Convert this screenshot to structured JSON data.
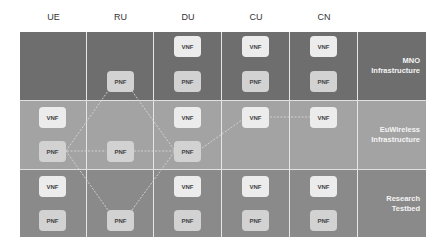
{
  "diagram": {
    "columns": [
      {
        "id": "ue",
        "label": "UE",
        "x": 20,
        "w": 67
      },
      {
        "id": "ru",
        "label": "RU",
        "x": 87,
        "w": 67
      },
      {
        "id": "du",
        "label": "DU",
        "x": 154,
        "w": 68
      },
      {
        "id": "cu",
        "label": "CU",
        "x": 222,
        "w": 68
      },
      {
        "id": "cn",
        "label": "CN",
        "x": 290,
        "w": 68
      }
    ],
    "rows": [
      {
        "id": "mno",
        "label_line1": "MNO",
        "label_line2": "Infrastructure",
        "color": "#6e6e6e",
        "top": 0,
        "h": 68
      },
      {
        "id": "euwireless",
        "label_line1": "EuWireless",
        "label_line2": "Infrastructure",
        "color": "#a3a3a3",
        "top": 68,
        "h": 69
      },
      {
        "id": "research",
        "label_line1": "Research",
        "label_line2": "Testbed",
        "color": "#8a8a8a",
        "top": 137,
        "h": 68
      }
    ],
    "nodes": {
      "mno": [
        {
          "col": "ru",
          "type": "pnf",
          "label": "PNF",
          "cx": 120,
          "cy": 81
        },
        {
          "col": "du",
          "type": "vnf",
          "label": "VNF",
          "cx": 188,
          "cy": 46
        },
        {
          "col": "du",
          "type": "pnf",
          "label": "PNF",
          "cx": 188,
          "cy": 81
        },
        {
          "col": "cu",
          "type": "vnf",
          "label": "VNF",
          "cx": 256,
          "cy": 46
        },
        {
          "col": "cu",
          "type": "pnf",
          "label": "PNF",
          "cx": 256,
          "cy": 81
        },
        {
          "col": "cn",
          "type": "vnf",
          "label": "VNF",
          "cx": 324,
          "cy": 46
        },
        {
          "col": "cn",
          "type": "pnf",
          "label": "PNF",
          "cx": 324,
          "cy": 81
        }
      ],
      "euwireless": [
        {
          "col": "ue",
          "type": "vnf",
          "label": "VNF",
          "cx": 53,
          "cy": 117
        },
        {
          "col": "ue",
          "type": "pnf",
          "label": "PNF",
          "cx": 53,
          "cy": 151
        },
        {
          "col": "ru",
          "type": "pnf",
          "label": "PNF",
          "cx": 120,
          "cy": 151
        },
        {
          "col": "du",
          "type": "vnf",
          "label": "VNF",
          "cx": 188,
          "cy": 117
        },
        {
          "col": "du",
          "type": "pnf",
          "label": "PNF",
          "cx": 188,
          "cy": 151
        },
        {
          "col": "cu",
          "type": "vnf",
          "label": "VNF",
          "cx": 256,
          "cy": 117
        },
        {
          "col": "cn",
          "type": "vnf",
          "label": "VNF",
          "cx": 324,
          "cy": 117
        }
      ],
      "research": [
        {
          "col": "ue",
          "type": "vnf",
          "label": "VNF",
          "cx": 53,
          "cy": 186
        },
        {
          "col": "ue",
          "type": "pnf",
          "label": "PNF",
          "cx": 53,
          "cy": 220
        },
        {
          "col": "ru",
          "type": "pnf",
          "label": "PNF",
          "cx": 120,
          "cy": 220
        },
        {
          "col": "du",
          "type": "vnf",
          "label": "VNF",
          "cx": 188,
          "cy": 186
        },
        {
          "col": "du",
          "type": "pnf",
          "label": "PNF",
          "cx": 188,
          "cy": 220
        },
        {
          "col": "cu",
          "type": "vnf",
          "label": "VNF",
          "cx": 256,
          "cy": 186
        },
        {
          "col": "cu",
          "type": "pnf",
          "label": "PNF",
          "cx": 256,
          "cy": 220
        },
        {
          "col": "cn",
          "type": "vnf",
          "label": "VNF",
          "cx": 324,
          "cy": 186
        },
        {
          "col": "cn",
          "type": "pnf",
          "label": "PNF",
          "cx": 324,
          "cy": 220
        }
      ]
    },
    "links": [
      {
        "from": "UE PNF (EuWireless)",
        "to": "RU PNF (MNO)",
        "x1": 66,
        "y1": 151,
        "x2": 108,
        "y2": 91
      },
      {
        "from": "RU PNF (MNO)",
        "to": "DU PNF (EuWireless)",
        "x1": 132,
        "y1": 91,
        "x2": 175,
        "y2": 151
      },
      {
        "from": "UE PNF (EuWireless)",
        "to": "RU PNF (EuWireless)",
        "x1": 67,
        "y1": 151,
        "x2": 106,
        "y2": 151
      },
      {
        "from": "RU PNF (EuWireless)",
        "to": "DU PNF (EuWireless)",
        "x1": 134,
        "y1": 151,
        "x2": 174,
        "y2": 151
      },
      {
        "from": "UE PNF (EuWireless)",
        "to": "RU PNF (Research)",
        "x1": 66,
        "y1": 151,
        "x2": 108,
        "y2": 210
      },
      {
        "from": "RU PNF (Research)",
        "to": "DU PNF (EuWireless)",
        "x1": 132,
        "y1": 210,
        "x2": 175,
        "y2": 151
      },
      {
        "from": "DU PNF (EuWireless)",
        "to": "CU VNF (EuWireless)",
        "x1": 202,
        "y1": 148,
        "x2": 242,
        "y2": 120
      },
      {
        "from": "CU VNF (EuWireless)",
        "to": "CN VNF (EuWireless)",
        "x1": 270,
        "y1": 117,
        "x2": 310,
        "y2": 117
      }
    ],
    "link_color": "#d6d6d6"
  }
}
